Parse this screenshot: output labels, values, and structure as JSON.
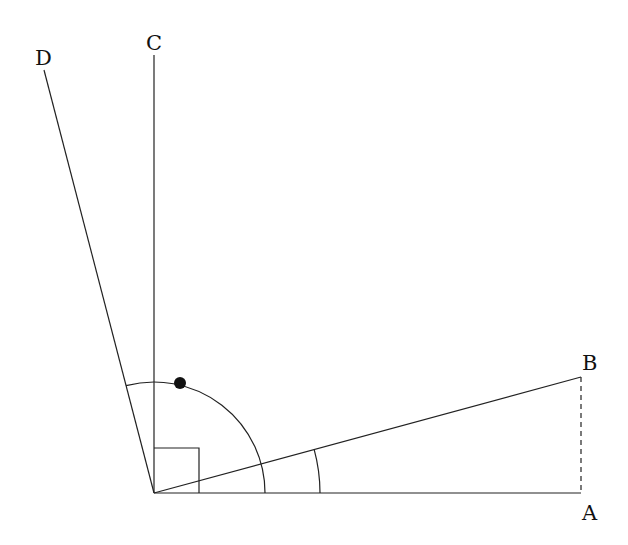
{
  "diagram": {
    "title": "",
    "points": {
      "O": {
        "x": 154,
        "y": 493
      },
      "A": {
        "x": 581,
        "y": 493,
        "label": "A"
      },
      "B": {
        "x": 581,
        "y": 377,
        "label": "B"
      },
      "C": {
        "x": 154,
        "y": 55,
        "label": "C"
      },
      "D": {
        "x": 44,
        "y": 70,
        "label": "D"
      }
    },
    "labels": {
      "A": "A",
      "B": "B",
      "C": "C",
      "D": "D"
    },
    "right_angle_size": 45,
    "arcs": [
      {
        "name": "arc-aob",
        "radius": 166,
        "from": "A",
        "to": "B"
      },
      {
        "name": "arc-aod",
        "radius": 111,
        "from": "A",
        "to": "D"
      }
    ],
    "marker_dot": {
      "x": 180,
      "y": 383,
      "r": 6
    },
    "dashed_segment": [
      "B",
      "A"
    ],
    "colors": {
      "stroke": "#222222",
      "text": "#111111",
      "background": "#ffffff"
    }
  }
}
